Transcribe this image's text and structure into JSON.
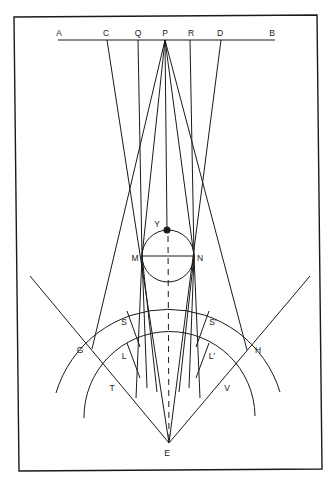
{
  "diagram": {
    "type": "geometric-construction",
    "labels": {
      "A": "A",
      "C": "C",
      "Q": "Q",
      "P": "P",
      "R": "R",
      "D": "D",
      "B": "B",
      "Y": "Y",
      "M": "M",
      "N": "N",
      "S": "S",
      "S_prime": "S′",
      "L": "L",
      "L_prime": "L′",
      "G": "G",
      "H": "H",
      "T": "T",
      "V": "V",
      "E": "E"
    },
    "colors": {
      "ink": "#1a1a1a",
      "background": "#ffffff"
    }
  }
}
